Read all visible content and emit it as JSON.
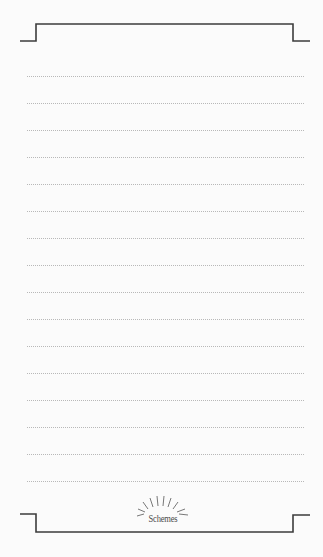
{
  "page": {
    "type": "lined-notepad",
    "background": "#fbfbfb",
    "frame_color": "#3c3c3c",
    "rule_color": "#b8b8b8",
    "rule_count": 16,
    "rule_start_y": 76,
    "rule_spacing": 27
  },
  "brand": {
    "label": "Schemes",
    "icon": "sunburst-icon"
  }
}
